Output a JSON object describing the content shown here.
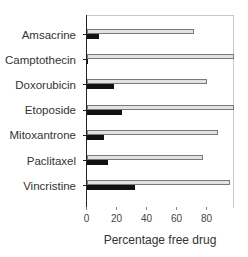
{
  "chart_data": {
    "type": "bar",
    "orientation": "horizontal",
    "title": "",
    "xlabel": "Percentage free drug",
    "ylabel": "",
    "xlim": [
      0,
      99
    ],
    "xticks": [
      0,
      20,
      40,
      60,
      80
    ],
    "grid": false,
    "legend": null,
    "categories": [
      "Amsacrine",
      "Camptothecin",
      "Doxorubicin",
      "Etoposide",
      "Mitoxantrone",
      "Paclitaxel",
      "Vincristine"
    ],
    "series": [
      {
        "name": "Series 1 (light gray)",
        "color": "#e2e2e2",
        "values": [
          71,
          98,
          80,
          98,
          87,
          77,
          95
        ]
      },
      {
        "name": "Series 2 (black)",
        "color": "#111111",
        "values": [
          8,
          0,
          18,
          23,
          11,
          14,
          32
        ]
      }
    ]
  }
}
